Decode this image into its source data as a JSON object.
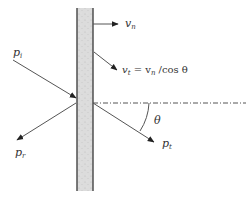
{
  "diagram": {
    "type": "wave-transmission-through-wall",
    "wall": {
      "fill": "#d9d9d9",
      "edge_color": "#444444"
    },
    "colors": {
      "line": "#555555",
      "arrow": "#222222",
      "text": "#333333"
    },
    "labels": {
      "incident": {
        "base": "p",
        "sub": "i"
      },
      "reflected": {
        "base": "p",
        "sub": "r"
      },
      "transmitted": {
        "base": "p",
        "sub": "t"
      },
      "normal_velocity": {
        "base": "v",
        "sub": "n"
      },
      "trace_velocity": {
        "base": "v",
        "sub": "t",
        "equation_rhs": " = v",
        "rhs_sub": "n",
        "rhs_tail": " /cos θ"
      },
      "angle": "θ"
    }
  }
}
